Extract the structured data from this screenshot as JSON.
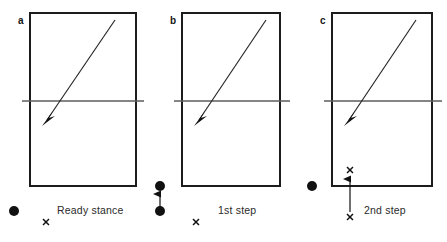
{
  "figure": {
    "background_color": "#ffffff",
    "line_color": "#1c1c1c",
    "net_color": "#5d5d5d",
    "marker_color": "#111111"
  },
  "panels": [
    {
      "letter": "a",
      "caption": "Ready stance",
      "court": {
        "x": 30,
        "y": 13,
        "width": 106,
        "height": 173
      },
      "net": {
        "x1": 22,
        "y1": 101,
        "x2": 144,
        "y2": 101
      },
      "shuttle_path": {
        "x1": 115,
        "y1": 20,
        "x2": 43,
        "y2": 126
      },
      "dot": {
        "cx": 14,
        "cy": 211,
        "r": 5
      },
      "x_mark": {
        "cx": 46,
        "cy": 222,
        "size": 4
      },
      "caption_pos": {
        "x": 57,
        "y": 214
      }
    },
    {
      "letter": "b",
      "caption": "1st step",
      "court": {
        "x": 182,
        "y": 13,
        "width": 98,
        "height": 173
      },
      "net": {
        "x1": 174,
        "y1": 101,
        "x2": 290,
        "y2": 101
      },
      "shuttle_path": {
        "x1": 266,
        "y1": 20,
        "x2": 195,
        "y2": 126
      },
      "dot": {
        "cx": 160,
        "cy": 186,
        "r": 5
      },
      "dot2": {
        "cx": 160,
        "cy": 211,
        "r": 5
      },
      "move_arrow": {
        "x1": 160,
        "y1": 207,
        "x2": 160,
        "y2": 192
      },
      "x_mark": {
        "cx": 196,
        "cy": 222,
        "size": 4
      },
      "caption_pos": {
        "x": 218,
        "y": 214
      }
    },
    {
      "letter": "c",
      "caption": "2nd step",
      "court": {
        "x": 332,
        "y": 13,
        "width": 100,
        "height": 173
      },
      "net": {
        "x1": 324,
        "y1": 101,
        "x2": 442,
        "y2": 101
      },
      "shuttle_path": {
        "x1": 416,
        "y1": 20,
        "x2": 345,
        "y2": 126
      },
      "dot": {
        "cx": 312,
        "cy": 186,
        "r": 5
      },
      "x_mark": {
        "cx": 350,
        "cy": 170,
        "size": 4
      },
      "x_mark2": {
        "cx": 350,
        "cy": 217,
        "size": 4
      },
      "move_arrow": {
        "x1": 350,
        "y1": 212,
        "x2": 350,
        "y2": 177
      },
      "caption_pos": {
        "x": 364,
        "y": 214
      }
    }
  ],
  "legend": {
    "dot_meaning": "player position",
    "x_meaning": "step target"
  }
}
